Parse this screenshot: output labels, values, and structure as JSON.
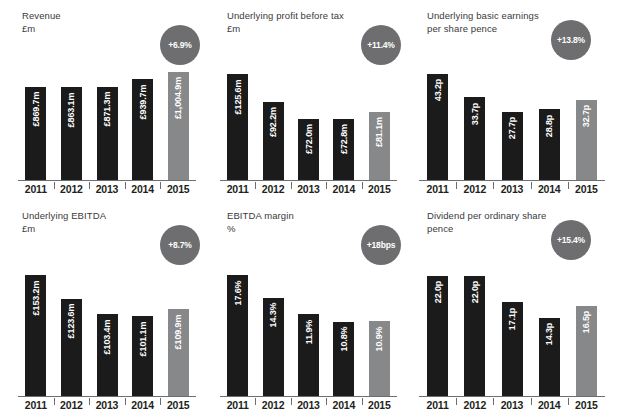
{
  "panels": [
    {
      "key": "revenue",
      "title": "Revenue",
      "units": "£m",
      "badge": "+6.9%",
      "chart_data": {
        "type": "bar",
        "title": "Revenue",
        "ylabel": "£m",
        "xlabel": "",
        "categories": [
          "2011",
          "2012",
          "2013",
          "2014",
          "2015"
        ],
        "values": [
          869.7,
          863.1,
          871.3,
          939.7,
          1004.9
        ],
        "labels": [
          "£869.7m",
          "£863.1m",
          "£871.3m",
          "£939.7m",
          "£1,004.9m"
        ],
        "highlight_index": 4,
        "ylim": [
          0,
          1100
        ],
        "grid": false,
        "legend": "none",
        "annotation": "+6.9%"
      }
    },
    {
      "key": "underlying-profit-before-tax",
      "title": "Underlying profit before tax",
      "units": "£m",
      "badge": "+11.4%",
      "chart_data": {
        "type": "bar",
        "title": "Underlying profit before tax",
        "ylabel": "£m",
        "xlabel": "",
        "categories": [
          "2011",
          "2012",
          "2013",
          "2014",
          "2015"
        ],
        "values": [
          125.6,
          92.2,
          72.0,
          72.8,
          81.1
        ],
        "labels": [
          "£125.6m",
          "£92.2m",
          "£72.0m",
          "£72.8m",
          "£81.1m"
        ],
        "highlight_index": 4,
        "ylim": [
          0,
          140
        ],
        "grid": false,
        "legend": "none",
        "annotation": "+11.4%"
      }
    },
    {
      "key": "underlying-basic-earnings-per-share",
      "title": "Underlying basic earnings\nper share pence",
      "units": "",
      "badge": "+13.8%",
      "chart_data": {
        "type": "bar",
        "title": "Underlying basic earnings per share pence",
        "ylabel": "pence",
        "xlabel": "",
        "categories": [
          "2011",
          "2012",
          "2013",
          "2014",
          "2015"
        ],
        "values": [
          43.2,
          33.7,
          27.7,
          28.8,
          32.7
        ],
        "labels": [
          "43.2p",
          "33.7p",
          "27.7p",
          "28.8p",
          "32.7p"
        ],
        "highlight_index": 4,
        "ylim": [
          0,
          48
        ],
        "grid": false,
        "legend": "none",
        "annotation": "+13.8%"
      }
    },
    {
      "key": "underlying-ebitda",
      "title": "Underlying EBITDA",
      "units": "£m",
      "badge": "+8.7%",
      "chart_data": {
        "type": "bar",
        "title": "Underlying EBITDA",
        "ylabel": "£m",
        "xlabel": "",
        "categories": [
          "2011",
          "2012",
          "2013",
          "2014",
          "2015"
        ],
        "values": [
          153.2,
          123.6,
          103.4,
          101.1,
          109.9
        ],
        "labels": [
          "£153.2m",
          "£123.6m",
          "£103.4m",
          "£101.1m",
          "£109.9m"
        ],
        "highlight_index": 4,
        "ylim": [
          0,
          170
        ],
        "grid": false,
        "legend": "none",
        "annotation": "+8.7%"
      }
    },
    {
      "key": "ebitda-margin",
      "title": "EBITDA margin",
      "units": "%",
      "badge": "+18bps",
      "chart_data": {
        "type": "bar",
        "title": "EBITDA margin",
        "ylabel": "%",
        "xlabel": "",
        "categories": [
          "2011",
          "2012",
          "2013",
          "2014",
          "2015"
        ],
        "values": [
          17.6,
          14.3,
          11.9,
          10.8,
          10.9
        ],
        "labels": [
          "17.6%",
          "14.3%",
          "11.9%",
          "10.8%",
          "10.9%"
        ],
        "highlight_index": 4,
        "ylim": [
          0,
          19.5
        ],
        "grid": false,
        "legend": "none",
        "annotation": "+18bps"
      }
    },
    {
      "key": "dividend-per-ordinary-share",
      "title": "Dividend per ordinary share\npence",
      "units": "",
      "badge": "+15.4%",
      "chart_data": {
        "type": "bar",
        "title": "Dividend per ordinary share pence",
        "ylabel": "pence",
        "xlabel": "",
        "categories": [
          "2011",
          "2012",
          "2013",
          "2014",
          "2015"
        ],
        "values": [
          22.0,
          22.0,
          17.1,
          14.3,
          16.5
        ],
        "labels": [
          "22.0p",
          "22.0p",
          "17.1p",
          "14.3p",
          "16.5p"
        ],
        "highlight_index": 4,
        "ylim": [
          0,
          24.5
        ],
        "grid": false,
        "legend": "none",
        "annotation": "+15.4%"
      }
    }
  ],
  "colors": {
    "bar_dark": "#1b1b1b",
    "bar_highlight": "#87888a",
    "badge_bg": "#6e6e70",
    "axis": "#6d6e70",
    "text": "#231f20",
    "title_text": "#3a3a3c"
  }
}
